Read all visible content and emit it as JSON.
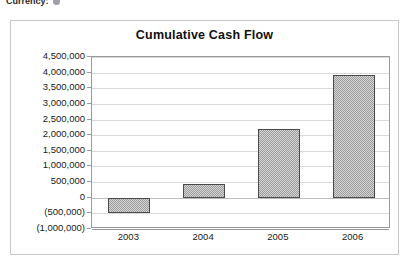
{
  "header": {
    "label": "Currency:",
    "glyph_name": "currency-indicator-dot"
  },
  "chart_data": {
    "type": "bar",
    "title": "Cumulative Cash Flow",
    "xlabel": "",
    "ylabel": "",
    "categories": [
      "2003",
      "2004",
      "2005",
      "2006"
    ],
    "values": [
      -500000,
      450000,
      2200000,
      3920000
    ],
    "ylim": [
      -1000000,
      4500000
    ],
    "ytick_values": [
      4500000,
      4000000,
      3500000,
      3000000,
      2500000,
      2000000,
      1500000,
      1000000,
      500000,
      0,
      -500000,
      -1000000
    ],
    "ytick_labels": [
      "4,500,000",
      "4,000,000",
      "3,500,000",
      "3,000,000",
      "2,500,000",
      "2,000,000",
      "1,500,000",
      "1,000,000",
      "500,000",
      "0",
      "(500,000)",
      "(1,000,000)"
    ],
    "grid": true,
    "legend": null,
    "series_name": "Cumulative Cash Flow",
    "bar_fill_color": "#9e9e9e",
    "bar_border_color": "#4a4a4a",
    "gridline_color": "#d9d9d9",
    "plot_background": "#ffffff",
    "frame_color": "#c8c8c8",
    "text_color": "#1a1a1a"
  }
}
